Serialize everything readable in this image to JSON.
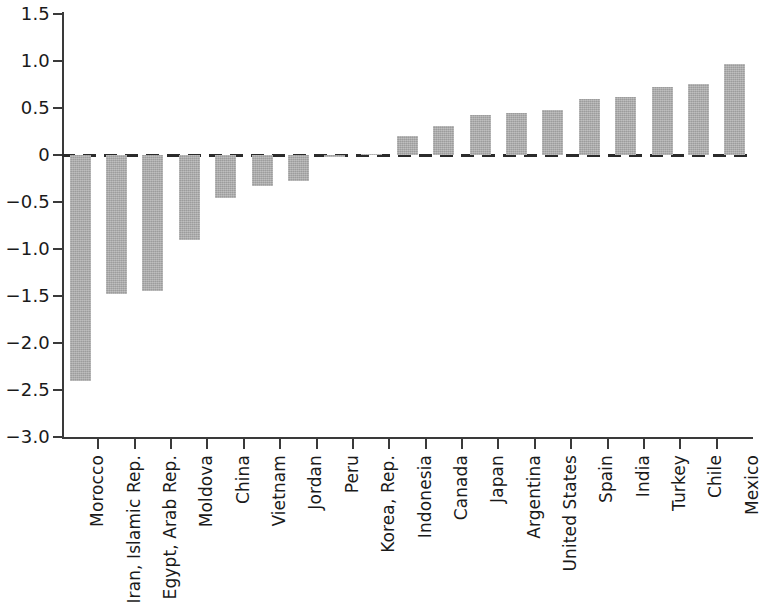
{
  "chart_data": {
    "type": "bar",
    "title": "",
    "subtitle": "",
    "xlabel": "",
    "ylabel": "",
    "ylim": [
      -3.0,
      1.5
    ],
    "ytick_labels": [
      "1.5",
      "1.0",
      "0.5",
      "0",
      "-0.5",
      "-1.0",
      "-1.5",
      "-2.0",
      "-2.5",
      "-3.0"
    ],
    "ytick_values": [
      1.5,
      1.0,
      0.5,
      0,
      -0.5,
      -1.0,
      -1.5,
      -2.0,
      -2.5,
      -3.0
    ],
    "grid": false,
    "legend": false,
    "zero_reference_line": true,
    "zero_reference_line_style": "dashed",
    "bar_color": "#ababab",
    "axis_color": "#3a3a3a",
    "categories": [
      "Morocco",
      "Iran, Islamic Rep.",
      "Egypt, Arab Rep.",
      "Moldova",
      "China",
      "Vietnam",
      "Jordan",
      "Peru",
      "Korea, Rep.",
      "Indonesia",
      "Canada",
      "Japan",
      "Argentina",
      "United States",
      "Spain",
      "India",
      "Turkey",
      "Chile",
      "Mexico"
    ],
    "values": [
      -2.4,
      -1.48,
      -1.45,
      -0.9,
      -0.46,
      -0.33,
      -0.28,
      -0.02,
      0.01,
      0.2,
      0.31,
      0.43,
      0.45,
      0.48,
      0.6,
      0.62,
      0.72,
      0.76,
      0.97
    ]
  }
}
